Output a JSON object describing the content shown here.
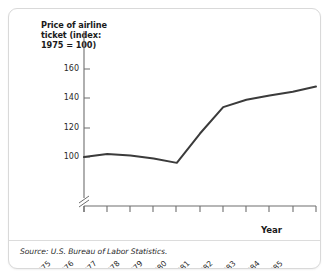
{
  "panel": {
    "source_note": "Source: U.S. Bureau of Labor Statistics."
  },
  "chart_data": {
    "type": "line",
    "title": "",
    "ylabel": "Price of airline ticket (index: 1975 = 100)",
    "xlabel": "Year",
    "categories": [
      "1975",
      "1976",
      "1977",
      "1978",
      "1979",
      "1980",
      "1981",
      "1982",
      "1983",
      "1984",
      "1985"
    ],
    "x": [
      1975,
      1976,
      1977,
      1978,
      1979,
      1980,
      1981,
      1982,
      1983,
      1984,
      1985
    ],
    "values": [
      100,
      102,
      101,
      99,
      96,
      116,
      134,
      139,
      142,
      144.5,
      148
    ],
    "series": [
      {
        "name": "Price of airline ticket (index: 1975 = 100)",
        "values": [
          100,
          102,
          101,
          99,
          96,
          116,
          134,
          139,
          142,
          144.5,
          148
        ]
      }
    ],
    "ylim": [
      96,
      165
    ],
    "yticks": [
      100,
      120,
      140,
      160
    ],
    "ytick_labels": [
      "100",
      "120",
      "140",
      "160"
    ],
    "xtick_labels": [
      "1975",
      "1976",
      "1977",
      "1978",
      "1979",
      "1980",
      "1981",
      "1982",
      "1983",
      "1984",
      "1985"
    ],
    "axis_break": true,
    "grid": false,
    "legend": "none",
    "line_color": "#3b3b3b"
  },
  "axes": {
    "y_title_line1": "Price of airline",
    "y_title_line2": "ticket (index:",
    "y_title_line3": "1975 = 100)",
    "x_title": "Year"
  }
}
